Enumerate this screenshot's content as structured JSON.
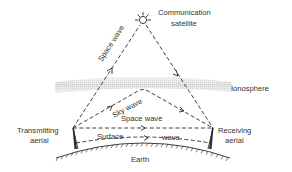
{
  "diagram": {
    "satellite_label_line1": "Communication",
    "satellite_label_line2": "satellite",
    "ionosphere_label": "Ionosphere",
    "transmitter_label_line1": "Transmitting",
    "transmitter_label_line2": "aerial",
    "receiver_label_line1": "Receiving",
    "receiver_label_line2": "aerial",
    "earth_label": "Earth",
    "waves": {
      "space_wave_satellite": "Space wave",
      "sky_wave": "Sky wave",
      "space_wave_direct": "Space wave",
      "surface_wave_part1": "Surface",
      "surface_wave_part2": "wave"
    },
    "colors": {
      "line": "#2a2a2a",
      "text": "#333333",
      "ionosphere": "#d9d9d9",
      "background": "#ffffff"
    },
    "icons": {
      "satellite": "satellite-icon",
      "transmitter": "antenna-mast-icon",
      "receiver": "antenna-mast-icon"
    }
  }
}
